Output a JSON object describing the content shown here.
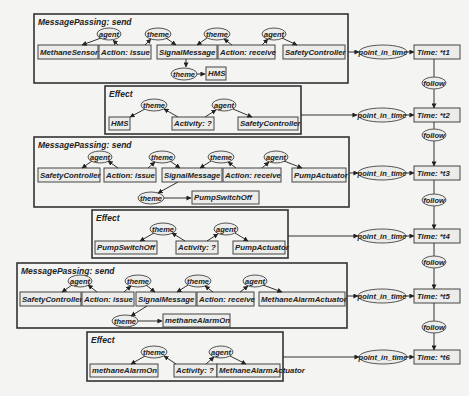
{
  "diagram": {
    "type": "conceptual-graph",
    "contexts": [
      {
        "id": "c1",
        "title": "MessagePassing: send",
        "concepts": [
          "MethaneSensor",
          "Action: issue",
          "SignalMessage",
          "Action: receive",
          "SafetyController",
          "HMS"
        ],
        "relations": [
          "agent",
          "theme",
          "theme",
          "agent",
          "theme"
        ]
      },
      {
        "id": "c2",
        "title": "Effect",
        "concepts": [
          "HMS",
          "Activity: ?",
          "SafetyController"
        ],
        "relations": [
          "theme",
          "agent"
        ]
      },
      {
        "id": "c3",
        "title": "MessagePassing: send",
        "concepts": [
          "SafetyController",
          "Action: issue",
          "SignalMessage",
          "Action: receive",
          "PumpActuator",
          "PumpSwitchOff"
        ],
        "relations": [
          "agent",
          "theme",
          "theme",
          "agent",
          "theme"
        ]
      },
      {
        "id": "c4",
        "title": "Effect",
        "concepts": [
          "PumpSwitchOff",
          "Activity: ?",
          "PumpActuator"
        ],
        "relations": [
          "theme",
          "agent"
        ]
      },
      {
        "id": "c5",
        "title": "MessagePassing: send",
        "concepts": [
          "SafetyController",
          "Action: issue",
          "SignalMessage",
          "Action: receive",
          "MethaneAlarmActuator",
          "methaneAlarmOn"
        ],
        "relations": [
          "agent",
          "theme",
          "theme",
          "agent",
          "theme"
        ]
      },
      {
        "id": "c6",
        "title": "Effect",
        "concepts": [
          "methaneAlarmOn",
          "Activity: ?",
          "MethaneAlarmActuator"
        ],
        "relations": [
          "theme",
          "agent"
        ]
      }
    ],
    "timeline": {
      "link_label": "point_in_time",
      "follow_label": "follow",
      "times": [
        "Time: *t1",
        "Time: *t2",
        "Time: *t3",
        "Time: *t4",
        "Time: *t5",
        "Time: *t6"
      ]
    }
  }
}
